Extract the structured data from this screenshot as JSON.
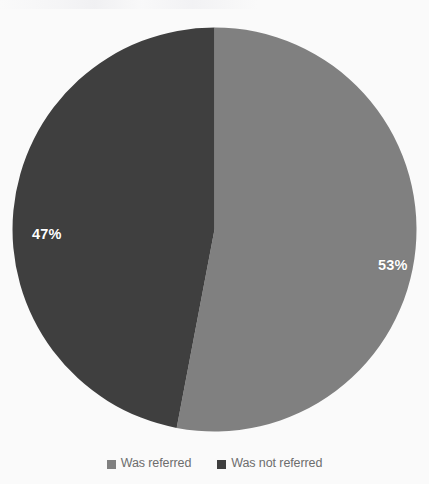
{
  "chart_data": {
    "type": "pie",
    "title": "",
    "subtitle": "",
    "xlabel": "",
    "ylabel": "",
    "grid": false,
    "legend_position": "bottom",
    "start_angle_deg": 0,
    "direction": "clockwise",
    "categories": [
      "Was referred",
      "Was not referred"
    ],
    "values": [
      53,
      47
    ],
    "value_unit": "%",
    "slices": [
      {
        "label": "Was referred",
        "value": 53,
        "data_label": "53%",
        "color": "#808080",
        "data_label_color": "#ffffff"
      },
      {
        "label": "Was not referred",
        "value": 47,
        "data_label": "47%",
        "color": "#3f3f3f",
        "data_label_color": "#ffffff"
      }
    ],
    "legend": [
      {
        "label": "Was referred",
        "color": "#808080",
        "marker": "square"
      },
      {
        "label": "Was not referred",
        "color": "#3f3f3f",
        "marker": "square"
      }
    ]
  },
  "colors": {
    "background": "#fafafa",
    "series_light_gray": "#808080",
    "series_dark_gray": "#3f3f3f",
    "legend_text": "#6d6d6d",
    "data_label": "#ffffff"
  },
  "geometry": {
    "center_x": 214,
    "center_y": 230,
    "radius": 202
  }
}
